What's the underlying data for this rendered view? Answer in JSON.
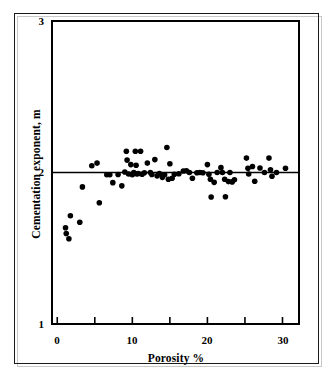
{
  "figure": {
    "title": "",
    "background_color": "#ffffff",
    "ink_color": "#000000",
    "frame_color": "#1a1a1a"
  },
  "axis_labels": {
    "x": "Porosity %",
    "y": "Cementation exponent, m"
  },
  "ticks": {
    "x_labels": [
      "0",
      "10",
      "20",
      "30"
    ],
    "y_labels": [
      "3",
      "2",
      "1"
    ]
  },
  "chart_data": {
    "type": "scatter",
    "title": "",
    "xlabel": "Porosity %",
    "ylabel": "Cementation exponent, m",
    "xlim": [
      -0.7,
      32.2
    ],
    "ylim": [
      1,
      3
    ],
    "xticks": [
      0,
      5,
      10,
      15,
      20,
      25,
      30
    ],
    "xticklabels": [
      "0",
      "",
      "10",
      "",
      "20",
      "",
      "30"
    ],
    "yticks": [
      1,
      2,
      3
    ],
    "yticklabels": [
      "1",
      "2",
      "3"
    ],
    "grid": false,
    "legend": null,
    "marker": {
      "shape": "circle",
      "color": "#000000",
      "size_px": 5.6
    },
    "annotations": [
      {
        "type": "hline",
        "y": 2.0,
        "color": "#000000",
        "width_px": 1.4,
        "label": "m = 2 reference line"
      }
    ],
    "series": [
      {
        "name": "Core measurements",
        "points": [
          [
            1.1,
            1.635
          ],
          [
            1.2,
            1.597
          ],
          [
            1.55,
            1.563
          ],
          [
            1.75,
            1.715
          ],
          [
            3.0,
            1.672
          ],
          [
            3.35,
            1.905
          ],
          [
            4.6,
            2.045
          ],
          [
            5.3,
            2.062
          ],
          [
            5.6,
            1.8
          ],
          [
            6.6,
            1.985
          ],
          [
            7.0,
            1.985
          ],
          [
            7.4,
            1.933
          ],
          [
            8.1,
            1.987
          ],
          [
            8.6,
            1.912
          ],
          [
            9.0,
            2.003
          ],
          [
            9.2,
            2.14
          ],
          [
            9.3,
            2.082
          ],
          [
            9.5,
            1.99
          ],
          [
            9.8,
            2.052
          ],
          [
            10.0,
            1.985
          ],
          [
            10.2,
            2.0
          ],
          [
            10.4,
            2.14
          ],
          [
            10.5,
            2.048
          ],
          [
            10.6,
            1.99
          ],
          [
            10.8,
            1.993
          ],
          [
            11.1,
            2.14
          ],
          [
            11.3,
            1.988
          ],
          [
            11.6,
            1.998
          ],
          [
            12.0,
            2.062
          ],
          [
            12.4,
            2.0
          ],
          [
            12.6,
            1.987
          ],
          [
            13.0,
            2.085
          ],
          [
            13.3,
            1.978
          ],
          [
            13.6,
            1.993
          ],
          [
            14.0,
            1.968
          ],
          [
            14.3,
            1.985
          ],
          [
            14.6,
            2.165
          ],
          [
            14.8,
            1.955
          ],
          [
            15.0,
            2.058
          ],
          [
            15.3,
            1.962
          ],
          [
            15.6,
            1.988
          ],
          [
            16.2,
            1.992
          ],
          [
            16.8,
            2.01
          ],
          [
            17.2,
            2.012
          ],
          [
            17.6,
            2.0
          ],
          [
            18.0,
            1.962
          ],
          [
            18.6,
            1.998
          ],
          [
            19.0,
            2.0
          ],
          [
            19.4,
            1.998
          ],
          [
            20.0,
            2.052
          ],
          [
            20.2,
            1.988
          ],
          [
            20.4,
            1.955
          ],
          [
            20.5,
            1.838
          ],
          [
            20.9,
            1.935
          ],
          [
            21.3,
            2.0
          ],
          [
            21.8,
            2.032
          ],
          [
            22.0,
            2.0
          ],
          [
            22.3,
            1.955
          ],
          [
            22.4,
            1.84
          ],
          [
            22.8,
            1.94
          ],
          [
            23.0,
            2.0
          ],
          [
            23.3,
            1.938
          ],
          [
            23.6,
            1.952
          ],
          [
            25.2,
            2.095
          ],
          [
            25.4,
            2.028
          ],
          [
            25.5,
            1.99
          ],
          [
            26.0,
            2.04
          ],
          [
            26.3,
            1.942
          ],
          [
            27.0,
            2.03
          ],
          [
            27.6,
            2.0
          ],
          [
            28.2,
            2.095
          ],
          [
            28.4,
            2.018
          ],
          [
            28.6,
            1.975
          ],
          [
            29.2,
            2.0
          ],
          [
            30.4,
            2.028
          ]
        ]
      }
    ]
  }
}
